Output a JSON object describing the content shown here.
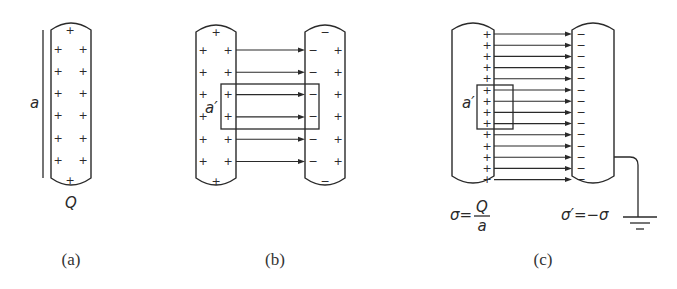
{
  "figure": {
    "panels": [
      {
        "id": "a",
        "caption": "(a)",
        "labels": {
          "height": "a",
          "charge": "Q"
        },
        "plate_charges_left": [
          "+",
          "+",
          "+",
          "+",
          "+",
          "+"
        ],
        "plate_charges_right": [
          "+",
          "+",
          "+",
          "+",
          "+",
          "+"
        ],
        "plate_charge_top": "+",
        "plate_charge_bottom": "+"
      },
      {
        "id": "b",
        "caption": "(b)",
        "labels": {
          "gaussian_area": "a′"
        },
        "left_plate": {
          "outer": "+",
          "inner": "+",
          "top": "+",
          "bottom": "+",
          "rows": 6
        },
        "right_plate": {
          "inner": "−",
          "outer": "+",
          "top": "−",
          "bottom": "−",
          "rows": 6
        },
        "field_lines": 6
      },
      {
        "id": "c",
        "caption": "(c)",
        "labels": {
          "gaussian_area": "a′",
          "sigma_left": "σ=",
          "sigma_num": "Q",
          "sigma_den": "a",
          "sigma_right": "σ′=−σ"
        },
        "left_plate_inner": "+",
        "right_plate_inner": "−",
        "field_lines": 14,
        "grounded": true
      }
    ]
  }
}
